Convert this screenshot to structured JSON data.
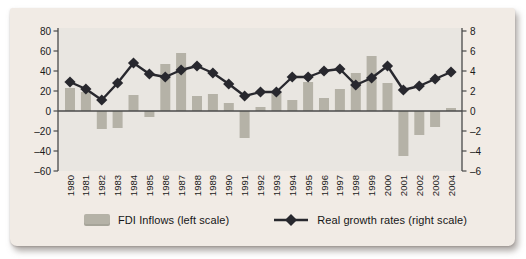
{
  "figure": {
    "colors": {
      "card_bg": "#f1ebe5",
      "plot_bg": "#e9e6e1",
      "bar": "#b5b2a7",
      "line": "#28282e",
      "axis": "#4a4a4a",
      "text": "#1a1a1a"
    },
    "legend_items": [
      {
        "label": "FDI Inflows (left scale)",
        "swatch": "bar-swatch"
      },
      {
        "label": "Real growth rates (right scale)",
        "swatch": "line-diamond-swatch"
      }
    ]
  },
  "chart_data": {
    "type": "combo-bar-line-dual-axis",
    "title": "",
    "xlabel": "",
    "ylabel_left": "",
    "ylabel_right": "",
    "grid": false,
    "legend_position": "bottom",
    "categories": [
      "1980",
      "1981",
      "1982",
      "1983",
      "1984",
      "1985",
      "1986",
      "1987",
      "1988",
      "1989",
      "1990",
      "1991",
      "1992",
      "1993",
      "1994",
      "1995",
      "1996",
      "1997",
      "1998",
      "1999",
      "2000",
      "2001",
      "2002",
      "2003",
      "2004"
    ],
    "series": [
      {
        "name": "FDI Inflows (left scale)",
        "type": "bar",
        "axis": "left",
        "values": [
          23,
          19,
          -18,
          -17,
          16,
          -6,
          47,
          58,
          15,
          17,
          8,
          -27,
          4,
          19,
          11,
          29,
          13,
          22,
          38,
          55,
          28,
          -45,
          -24,
          -16,
          3
        ]
      },
      {
        "name": "Real growth rates (right scale)",
        "type": "line-diamond",
        "axis": "right",
        "values": [
          2.9,
          2.2,
          1.1,
          2.8,
          4.8,
          3.7,
          3.4,
          4.1,
          4.5,
          3.8,
          2.7,
          1.5,
          1.9,
          1.9,
          3.4,
          3.4,
          4.0,
          4.2,
          2.6,
          3.3,
          4.5,
          2.1,
          2.5,
          3.2,
          3.9
        ]
      }
    ],
    "left_axis": {
      "range": [
        -60,
        80
      ],
      "ticks": [
        80,
        60,
        40,
        20,
        0,
        -20,
        -40,
        -60
      ]
    },
    "right_axis": {
      "range": [
        -6,
        8
      ],
      "ticks": [
        8,
        6,
        4,
        2,
        0,
        -2,
        -4,
        -6
      ]
    }
  }
}
